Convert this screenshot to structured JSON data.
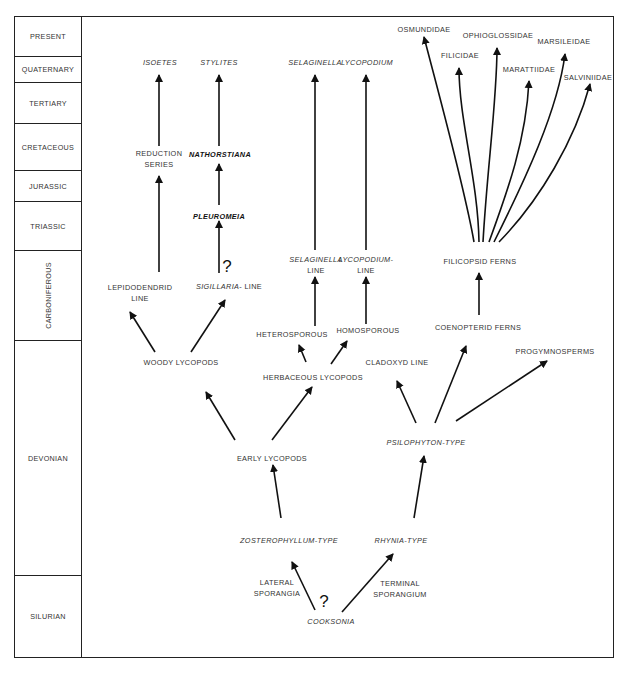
{
  "diagram": {
    "type": "phylogenetic-tree",
    "periods": [
      {
        "label": "PRESENT",
        "top": 0,
        "height": 40
      },
      {
        "label": "QUATERNARY",
        "top": 40,
        "height": 26
      },
      {
        "label": "TERTIARY",
        "top": 66,
        "height": 41
      },
      {
        "label": "CRETACEOUS",
        "top": 107,
        "height": 47
      },
      {
        "label": "JURASSIC",
        "top": 154,
        "height": 31
      },
      {
        "label": "TRIASSIC",
        "top": 185,
        "height": 49
      },
      {
        "label": "CARBONIFEROUS",
        "top": 234,
        "height": 90,
        "vertical": true
      },
      {
        "label": "DEVONIAN",
        "top": 324,
        "height": 235
      },
      {
        "label": "SILURIAN",
        "top": 559,
        "height": 83
      }
    ],
    "nodes": {
      "isoetes": "ISOETES",
      "stylites": "STYLITES",
      "selaginella_top": "SELAGINELLA",
      "lycopodium_top": "LYCOPODIUM",
      "osmundidae": "OSMUNDIDAE",
      "ophioglossidae": "OPHIOGLOSSIDAE",
      "filicidae": "FILICIDAE",
      "marsileidae": "MARSILEIDAE",
      "marattiidae": "MARATTIIDAE",
      "salviniidae": "SALVINIIDAE",
      "reduction_series_1": "REDUCTION",
      "reduction_series_2": "SERIES",
      "nathorstiana": "NATHORSTIANA",
      "pleuromeia": "PLEUROMEIA",
      "lepidodendrid_1": "LEPIDODENDRID",
      "lepidodendrid_2": "LINE",
      "sigillaria_italic": "SIGILLARIA",
      "sigillaria_rest": "- LINE",
      "selaginella_line_1": "SELAGINELLA",
      "selaginella_line_2": "LINE",
      "lycopodium_line_1": "LYCOPODIUM-",
      "lycopodium_line_2": "LINE",
      "filicopsid_ferns": "FILICOPSID FERNS",
      "heterosporous": "HETEROSPOROUS",
      "homosporous": "HOMOSPOROUS",
      "coenopterid_ferns": "COENOPTERID FERNS",
      "cladoxyd_line": "CLADOXYD LINE",
      "progymnosperms": "PROGYMNOSPERMS",
      "woody_lycopods": "WOODY LYCOPODS",
      "herbaceous_lycopods": "HERBACEOUS LYCOPODS",
      "psilophyton_italic": "PSILOPHYTON",
      "psilophyton_rest": "-TYPE",
      "early_lycopods": "EARLY LYCOPODS",
      "zosterophyllum_italic": "ZOSTEROPHYLLUM",
      "zosterophyllum_rest": "-TYPE",
      "rhynia_italic": "RHYNIA",
      "rhynia_rest": "-TYPE",
      "lateral_1": "LATERAL",
      "lateral_2": "SPORANGIA",
      "terminal_1": "TERMINAL",
      "terminal_2": "SPORANGIUM",
      "cooksonia": "COOKSONIA",
      "question_mark": "?"
    }
  }
}
